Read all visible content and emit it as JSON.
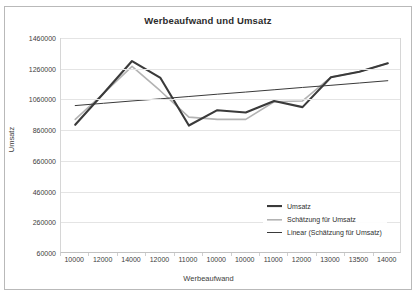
{
  "chart_data": {
    "type": "line",
    "title": "Werbeaufwand und Umsatz",
    "xlabel": "Werbeaufwand",
    "ylabel": "Umsatz",
    "categories": [
      "10000",
      "12000",
      "14000",
      "12000",
      "11000",
      "10000",
      "10000",
      "11000",
      "12000",
      "13000",
      "13500",
      "14000"
    ],
    "ylim": [
      60000,
      1460000
    ],
    "yticks": [
      "60000",
      "260000",
      "460000",
      "660000",
      "860000",
      "1060000",
      "1260000",
      "1460000"
    ],
    "ytick_values": [
      60000,
      260000,
      460000,
      660000,
      860000,
      1060000,
      1260000,
      1460000
    ],
    "grid": true,
    "legend_position": "bottom-right",
    "series": [
      {
        "name": "Umsatz",
        "color": "#3a3a3a",
        "width": 2.1,
        "values": [
          895000,
          1100000,
          1310000,
          1200000,
          890000,
          990000,
          975000,
          1050000,
          1010000,
          1205000,
          1240000,
          1295000
        ]
      },
      {
        "name": "Schätzung für Umsatz",
        "color": "#b3b3b3",
        "width": 1.6,
        "values": [
          930000,
          1100000,
          1275000,
          1115000,
          945000,
          930000,
          930000,
          1045000,
          1050000,
          1205000,
          1240000,
          1295000
        ]
      },
      {
        "name": "Linear (Schätzung für Umsatz)",
        "color": "#3a3a3a",
        "width": 1.0,
        "values": [
          1020000,
          1035000,
          1050000,
          1064000,
          1079000,
          1094000,
          1108000,
          1123000,
          1138000,
          1152000,
          1167000,
          1182000
        ]
      }
    ]
  },
  "legend": {
    "items": [
      {
        "label": "Umsatz"
      },
      {
        "label": "Schätzung für Umsatz"
      },
      {
        "label": "Linear (Schätzung für Umsatz)"
      }
    ]
  }
}
